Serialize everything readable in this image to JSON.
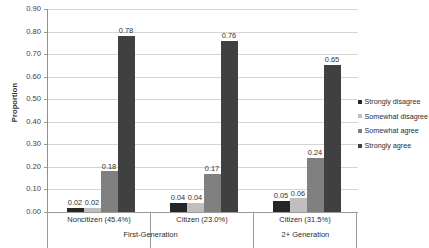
{
  "chart_data": {
    "type": "bar",
    "title": "",
    "xlabel": "",
    "ylabel": "Proportion",
    "ylim": [
      0.0,
      0.9
    ],
    "ytick_step": 0.1,
    "grid": true,
    "legend_position": "right",
    "categories": [
      "Noncitizen (45.4%)",
      "Citizen (23.0%)",
      "Citizen (31.5%)"
    ],
    "group_tiers": [
      {
        "label": "First-Generation",
        "spans": [
          0,
          1
        ]
      },
      {
        "label": "2+ Generation",
        "spans": [
          2
        ]
      }
    ],
    "series": [
      {
        "name": "Strongly disagree",
        "color": "#262626",
        "values": [
          0.02,
          0.04,
          0.05
        ]
      },
      {
        "name": "Somewhat disagree",
        "color": "#bfbfbf",
        "values": [
          0.02,
          0.04,
          0.06
        ]
      },
      {
        "name": "Somewhat agree",
        "color": "#808080",
        "values": [
          0.18,
          0.17,
          0.24
        ]
      },
      {
        "name": "Strongly agree",
        "color": "#404040",
        "values": [
          0.78,
          0.76,
          0.65
        ]
      }
    ],
    "ytick_labels": [
      "0.90",
      "0.80",
      "0.70",
      "0.60",
      "0.50",
      "0.40",
      "0.30",
      "0.20",
      "0.10",
      "0.00"
    ],
    "data_labels": [
      [
        "0.02",
        "0.02",
        "0.18",
        "0.78"
      ],
      [
        "0.04",
        "0.04",
        "0.17",
        "0.76"
      ],
      [
        "0.05",
        "0.06",
        "0.24",
        "0.65"
      ]
    ]
  }
}
